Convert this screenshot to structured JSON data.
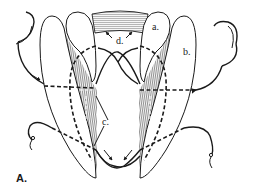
{
  "figure": {
    "panel_label": "A.",
    "labels": {
      "a": "a.",
      "b": "b.",
      "c": "c.",
      "d": "d."
    },
    "colors": {
      "ink": "#1a1a1a",
      "background": "#ffffff",
      "hatch": "#6a6a6a"
    }
  }
}
